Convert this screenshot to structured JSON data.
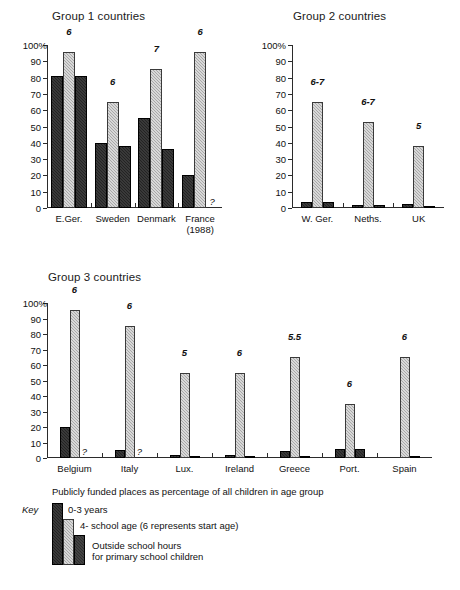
{
  "legend": {
    "key_word": "Key",
    "heading": "Publicly funded places as percentage of all children in age group",
    "items": [
      {
        "label": "0-3 years",
        "series": "0-3 years"
      },
      {
        "label": "4- school age (6 represents start age)",
        "series": "4- school age"
      },
      {
        "label_line1": "Outside school hours",
        "label_line2": "for primary school children",
        "series": "Outside school hours"
      }
    ]
  },
  "colors": {
    "dark_bar": "#232323",
    "light_bar": "#a8a8a8",
    "third_bar": "#2e2e2e",
    "axis": "#2b2b2b",
    "text": "#111111"
  },
  "panels": [
    {
      "id": "group1",
      "title": "Group 1 countries"
    },
    {
      "id": "group2",
      "title": "Group 2 countries"
    },
    {
      "id": "group3",
      "title": "Group 3 countries"
    }
  ],
  "chart_data": [
    {
      "type": "bar",
      "title": "Group 1 countries",
      "xlabel": "",
      "ylabel": "",
      "ylim": [
        0,
        100
      ],
      "yticks": [
        0,
        10,
        20,
        30,
        40,
        50,
        60,
        70,
        80,
        90,
        100
      ],
      "ytick_labels": [
        "0",
        "10",
        "20",
        "30",
        "40",
        "50",
        "60",
        "70",
        "80",
        "90",
        "100%"
      ],
      "grid": false,
      "legend_position": "below-figure",
      "categories": [
        "E.Ger.",
        "Sweden",
        "Denmark",
        "France\n(1988)"
      ],
      "category_labels": [
        {
          "line1": "E.Ger.",
          "line2": ""
        },
        {
          "line1": "Sweden",
          "line2": ""
        },
        {
          "line1": "Denmark",
          "line2": ""
        },
        {
          "line1": "France",
          "line2": "(1988)"
        }
      ],
      "series": [
        {
          "name": "0-3 years",
          "values": [
            81,
            40,
            55.5,
            20.5
          ]
        },
        {
          "name": "4- school age",
          "values": [
            95.5,
            65,
            85.5,
            95.5
          ]
        },
        {
          "name": "Outside school hours",
          "values": [
            81,
            38,
            36,
            null
          ]
        }
      ],
      "annotations": [
        {
          "category": "E.Ger.",
          "text": "6"
        },
        {
          "category": "Sweden",
          "text": "6"
        },
        {
          "category": "Denmark",
          "text": "7"
        },
        {
          "category": "France",
          "text": "6"
        }
      ],
      "missing_markers": [
        {
          "category": "France",
          "series": "Outside school hours",
          "text": "?"
        }
      ]
    },
    {
      "type": "bar",
      "title": "Group 2 countries",
      "xlabel": "",
      "ylabel": "",
      "ylim": [
        0,
        100
      ],
      "yticks": [
        0,
        10,
        20,
        30,
        40,
        50,
        60,
        70,
        80,
        90,
        100
      ],
      "ytick_labels": [
        "0",
        "10",
        "20",
        "30",
        "40",
        "50",
        "60",
        "70",
        "80",
        "90",
        "100%"
      ],
      "grid": false,
      "legend_position": "below-figure",
      "categories": [
        "W. Ger.",
        "Neths.",
        "UK"
      ],
      "category_labels": [
        {
          "line1": "W. Ger.",
          "line2": ""
        },
        {
          "line1": "Neths.",
          "line2": ""
        },
        {
          "line1": "UK",
          "line2": ""
        }
      ],
      "series": [
        {
          "name": "0-3 years",
          "values": [
            3.5,
            2,
            2.5
          ]
        },
        {
          "name": "4- school age",
          "values": [
            65,
            52.5,
            38
          ]
        },
        {
          "name": "Outside school hours",
          "values": [
            3.5,
            2,
            1.5
          ]
        }
      ],
      "annotations": [
        {
          "category": "W. Ger.",
          "text": "6-7"
        },
        {
          "category": "Neths.",
          "text": "6-7"
        },
        {
          "category": "UK",
          "text": "5"
        }
      ],
      "missing_markers": []
    },
    {
      "type": "bar",
      "title": "Group 3 countries",
      "xlabel": "",
      "ylabel": "",
      "ylim": [
        0,
        100
      ],
      "yticks": [
        0,
        10,
        20,
        30,
        40,
        50,
        60,
        70,
        80,
        90,
        100
      ],
      "ytick_labels": [
        "0",
        "10",
        "20",
        "30",
        "40",
        "50",
        "60",
        "70",
        "80",
        "90",
        "100%"
      ],
      "grid": false,
      "legend_position": "below-figure",
      "categories": [
        "Belgium",
        "Italy",
        "Lux.",
        "Ireland",
        "Greece",
        "Port.",
        "Spain"
      ],
      "category_labels": [
        {
          "line1": "Belgium",
          "line2": ""
        },
        {
          "line1": "Italy",
          "line2": ""
        },
        {
          "line1": "Lux.",
          "line2": ""
        },
        {
          "line1": "Ireland",
          "line2": ""
        },
        {
          "line1": "Greece",
          "line2": ""
        },
        {
          "line1": "Port.",
          "line2": ""
        },
        {
          "line1": "Spain",
          "line2": ""
        }
      ],
      "series": [
        {
          "name": "0-3 years",
          "values": [
            20,
            5,
            2,
            2,
            4.5,
            5.5,
            0
          ]
        },
        {
          "name": "4- school age",
          "values": [
            95.5,
            85,
            55,
            55,
            65,
            35,
            65
          ]
        },
        {
          "name": "Outside school hours",
          "values": [
            null,
            null,
            1,
            1,
            1,
            6,
            0.5
          ]
        }
      ],
      "annotations": [
        {
          "category": "Belgium",
          "text": "6"
        },
        {
          "category": "Italy",
          "text": "6"
        },
        {
          "category": "Lux.",
          "text": "5"
        },
        {
          "category": "Ireland",
          "text": "6"
        },
        {
          "category": "Greece",
          "text": "5.5"
        },
        {
          "category": "Port.",
          "text": "6"
        },
        {
          "category": "Spain",
          "text": "6"
        }
      ],
      "missing_markers": [
        {
          "category": "Belgium",
          "series": "Outside school hours",
          "text": "?"
        },
        {
          "category": "Italy",
          "series": "Outside school hours",
          "text": "?"
        }
      ]
    }
  ]
}
